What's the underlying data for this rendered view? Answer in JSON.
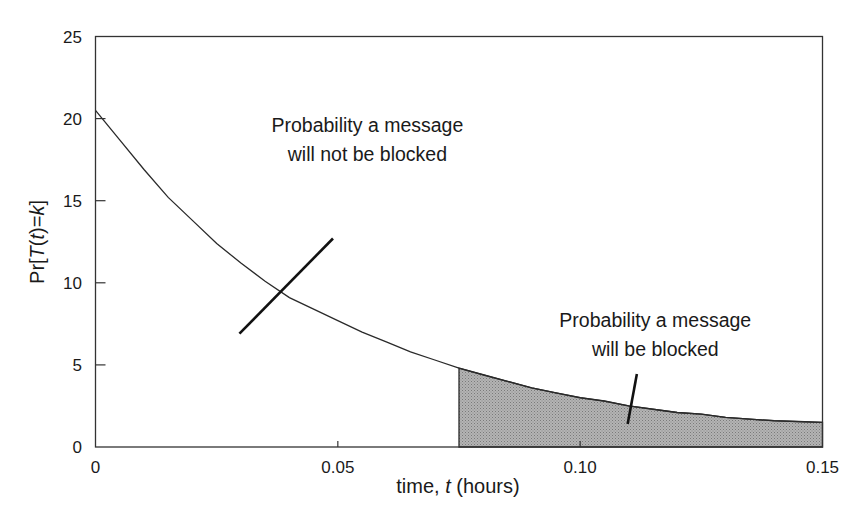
{
  "chart_data": {
    "type": "area",
    "title": "",
    "xlabel": "time, t (hours)",
    "xlabel_parts": [
      "time, ",
      "t",
      " (hours)"
    ],
    "ylabel": "Pr[T(t)=k]",
    "ylabel_parts": [
      "Pr[",
      "T",
      "(",
      "t",
      ")=",
      "k",
      "]"
    ],
    "xlim": [
      0,
      0.15
    ],
    "ylim": [
      0,
      25
    ],
    "xticks": [
      0,
      0.05,
      0.1,
      0.15
    ],
    "xtick_labels": [
      "0",
      "0.05",
      "0.10",
      "0.15"
    ],
    "yticks": [
      0,
      5,
      10,
      15,
      20,
      25
    ],
    "ytick_labels": [
      "0",
      "5",
      "10",
      "15",
      "20",
      "25"
    ],
    "grid": false,
    "legend": null,
    "series": [
      {
        "name": "Pr[T(t)=k]",
        "x": [
          0,
          0.005,
          0.01,
          0.015,
          0.02,
          0.025,
          0.03,
          0.035,
          0.04,
          0.045,
          0.05,
          0.055,
          0.06,
          0.065,
          0.07,
          0.075,
          0.08,
          0.085,
          0.09,
          0.095,
          0.1,
          0.105,
          0.11,
          0.115,
          0.12,
          0.125,
          0.13,
          0.135,
          0.14,
          0.145,
          0.15
        ],
        "y": [
          20.5,
          18.7,
          16.9,
          15.2,
          13.8,
          12.4,
          11.2,
          10.1,
          9.1,
          8.4,
          7.7,
          7.0,
          6.4,
          5.8,
          5.3,
          4.8,
          4.4,
          4.0,
          3.6,
          3.3,
          3.0,
          2.8,
          2.5,
          2.3,
          2.1,
          2.0,
          1.8,
          1.7,
          1.6,
          1.55,
          1.5
        ]
      }
    ],
    "shaded_region": {
      "x_from": 0.075,
      "x_to": 0.15,
      "fill": "#a8a8a8",
      "meaning": "Probability a message will be blocked"
    },
    "annotations": [
      {
        "lines": [
          "Probability a message",
          "will not be blocked"
        ],
        "text_center": [
          0.0561,
          19.2
        ],
        "leader_from": [
          0.0297,
          6.9
        ],
        "leader_to": [
          0.049,
          12.7
        ]
      },
      {
        "lines": [
          "Probability a message",
          "will be blocked"
        ],
        "text_center": [
          0.1155,
          7.3
        ],
        "leader_from": [
          0.1117,
          4.45
        ],
        "leader_to": [
          0.1098,
          1.4
        ]
      }
    ]
  },
  "colors": {
    "axis": "#333333",
    "curve": "#2a2a2a",
    "shade": "#a8a8a8",
    "text": "#1a1a1a",
    "background": "#ffffff"
  }
}
